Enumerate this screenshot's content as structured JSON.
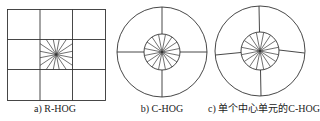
{
  "figures": [
    {
      "id": "a",
      "caption": "a) R-HOG",
      "shape": "rectangular-grid",
      "grid": "3x3",
      "center_spokes": 16
    },
    {
      "id": "b",
      "caption": "b) C-HOG",
      "shape": "circular",
      "outer_sectors": 4,
      "center_spokes": 16
    },
    {
      "id": "c",
      "caption": "c) 单个中心单元的C-HOG",
      "shape": "circular",
      "outer_sectors": 4,
      "center_spokes": 16
    }
  ],
  "colors": {
    "line": "#333333",
    "background": "#ffffff"
  }
}
